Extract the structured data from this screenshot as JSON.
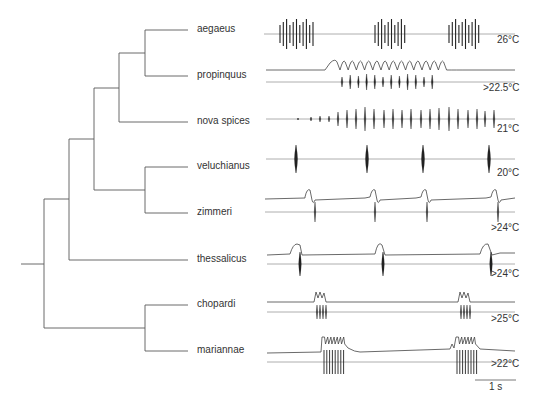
{
  "figure": {
    "type": "phylogenetic tree with song oscillograms",
    "line_color": "#555555",
    "trace_color": "#222222",
    "baseline_color": "#9a9a9a"
  },
  "tree": {
    "root_stub": {
      "x1": 21,
      "x2": 44,
      "y": 264
    },
    "nodes": [
      {
        "id": "A",
        "x": 145,
        "y1": 30,
        "y2": 76,
        "parent_x": 119,
        "parent_y": 53
      },
      {
        "id": "B",
        "x": 119,
        "y1": 53,
        "y2": 122,
        "parent_x": 94,
        "parent_y": 88
      },
      {
        "id": "C",
        "x": 145,
        "y1": 167,
        "y2": 213,
        "parent_x": 94,
        "parent_y": 190
      },
      {
        "id": "D",
        "x": 94,
        "y1": 88,
        "y2": 190,
        "parent_x": 69,
        "parent_y": 139
      },
      {
        "id": "E",
        "x": 69,
        "y1": 139,
        "y2": 260,
        "parent_x": 44,
        "parent_y": 199
      },
      {
        "id": "F",
        "x": 145,
        "y1": 305,
        "y2": 351,
        "parent_x": 44,
        "parent_y": 328
      },
      {
        "id": "root",
        "x": 44,
        "y1": 199,
        "y2": 328
      }
    ],
    "tip_x": 188
  },
  "species": [
    {
      "name": "aegaeus",
      "y": 30,
      "parent_x": 145,
      "temperature": "26°C"
    },
    {
      "name": "propinquus",
      "y": 76,
      "parent_x": 145,
      "temperature": ">22.5°C"
    },
    {
      "name": "nova spices",
      "y": 122,
      "parent_x": 119,
      "temperature": "21°C"
    },
    {
      "name": "veluchianus",
      "y": 167,
      "parent_x": 145,
      "temperature": "20°C"
    },
    {
      "name": "zimmeri",
      "y": 213,
      "parent_x": 145,
      "temperature": ">24°C"
    },
    {
      "name": "thessalicus",
      "y": 260,
      "parent_x": 69,
      "temperature": ">24°C"
    },
    {
      "name": "chopardi",
      "y": 305,
      "parent_x": 145,
      "temperature": ">25°C"
    },
    {
      "name": "mariannae",
      "y": 351,
      "parent_x": 145,
      "temperature": ">22°C"
    }
  ],
  "scale_bar": {
    "label": "1 s",
    "x1": 475,
    "x2": 516,
    "y": 380
  }
}
